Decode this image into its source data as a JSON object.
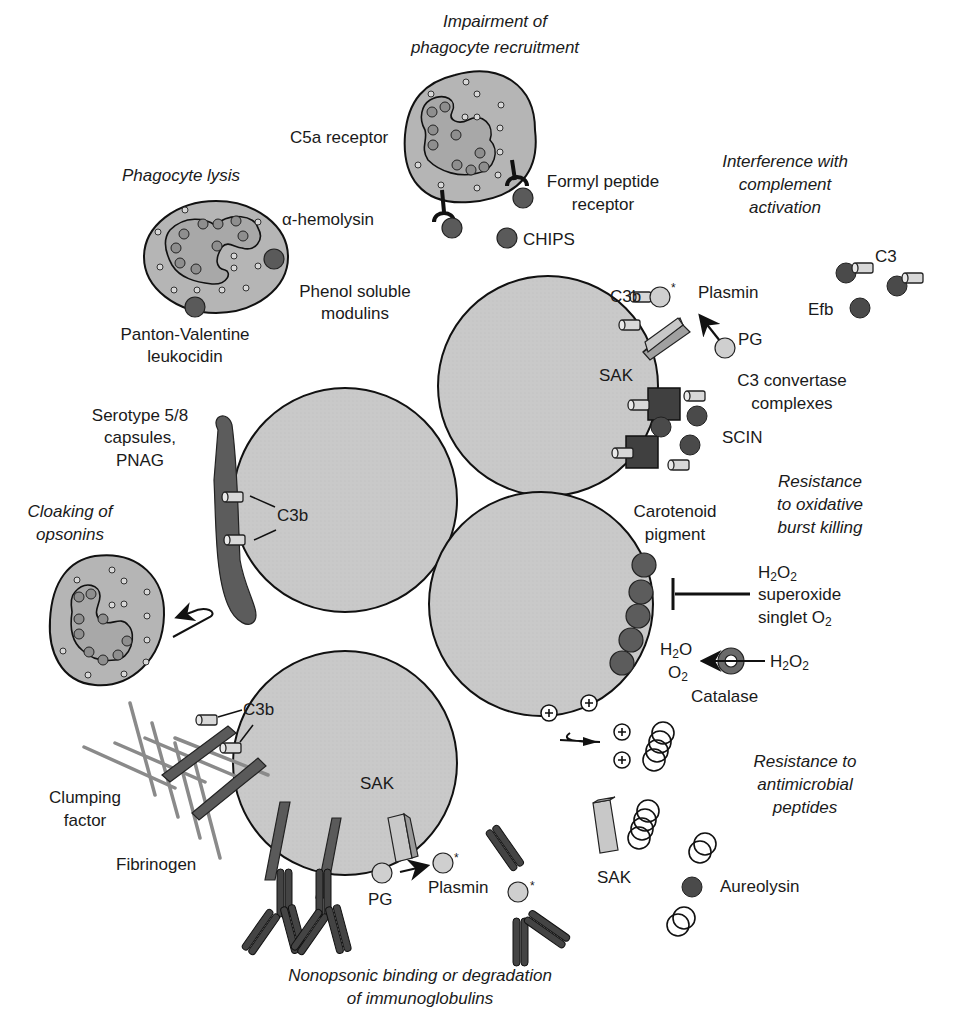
{
  "figure": {
    "colors": {
      "cell_fill": "#c8c8c8",
      "phagocyte_fill": "#b8b8b8",
      "dark_protein": "#555555",
      "outline": "#111111",
      "fibrinogen": "#8a8a8a"
    }
  },
  "headings": {
    "recruitment": [
      "Impairment of",
      "phagocyte recruitment"
    ],
    "lysis": "Phagocyte lysis",
    "complement": [
      "Interference with",
      "complement",
      "activation"
    ],
    "oxidative": [
      "Resistance",
      "to oxidative",
      "burst killing"
    ],
    "cloaking": [
      "Cloaking of",
      "opsonins"
    ],
    "antimicrobial": [
      "Resistance to",
      "antimicrobial",
      "peptides"
    ],
    "immunoglobulins": [
      "Nonopsonic binding or degradation",
      "of immunoglobulins"
    ]
  },
  "labels": {
    "c5a_receptor": "C5a receptor",
    "formyl_peptide_receptor": [
      "Formyl peptide",
      "receptor"
    ],
    "chips": "CHIPS",
    "alpha_hemolysin": "α-hemolysin",
    "phenol_soluble_modulins": [
      "Phenol soluble",
      "modulins"
    ],
    "pvl": [
      "Panton-Valentine",
      "leukocidin"
    ],
    "c3b_top": "C3b",
    "plasmin_top": "Plasmin",
    "pg_top": "PG",
    "sak_top": "SAK",
    "c3": "C3",
    "efb": "Efb",
    "c3_convertase": [
      "C3 convertase",
      "complexes"
    ],
    "scin": "SCIN",
    "serotype": [
      "Serotype 5/8",
      "capsules,",
      "PNAG"
    ],
    "c3b_capsule": "C3b",
    "carotenoid": [
      "Carotenoid",
      "pigment"
    ],
    "ros": {
      "h2o2": "H",
      "superoxide": "superoxide",
      "singlet": "singlet O"
    },
    "catalase": "Catalase",
    "catalase_products": {
      "water": "H",
      "oxygen": "O"
    },
    "catalase_substrate": "H",
    "c3b_bottom": "C3b",
    "clumping_factor": [
      "Clumping",
      "factor"
    ],
    "fibrinogen": "Fibrinogen",
    "sak_bottom": "SAK",
    "pg_bottom": "PG",
    "plasmin_bottom": "Plasmin",
    "sak_peptide": "SAK",
    "aureolysin": "Aureolysin",
    "asterisk": "*"
  }
}
